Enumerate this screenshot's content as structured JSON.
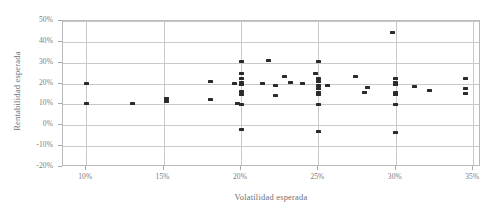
{
  "chart_data": {
    "type": "scatter",
    "title": "",
    "xlabel": "Volatilidad esperada",
    "ylabel": "Rentabilidad esperada",
    "xlim": [
      0.085,
      0.355
    ],
    "ylim": [
      -0.2,
      0.5
    ],
    "grid": true,
    "legend": false,
    "legend_position": "none",
    "x_ticks": [
      0.1,
      0.15,
      0.2,
      0.25,
      0.3,
      0.35
    ],
    "x_tick_labels": [
      "10%",
      "15%",
      "20%",
      "25%",
      "30%",
      "35%"
    ],
    "y_ticks": [
      -0.2,
      -0.1,
      0.0,
      0.1,
      0.2,
      0.3,
      0.4,
      0.5
    ],
    "y_tick_labels": [
      "-20%",
      "-10%",
      "0%",
      "10%",
      "20%",
      "30%",
      "40%",
      "50%"
    ],
    "marker": "square",
    "marker_color": "#2b2b2b",
    "series": [
      {
        "name": "Carteras",
        "points": [
          [
            0.1,
            0.2
          ],
          [
            0.1,
            0.105
          ],
          [
            0.13,
            0.105
          ],
          [
            0.152,
            0.128
          ],
          [
            0.152,
            0.115
          ],
          [
            0.18,
            0.21
          ],
          [
            0.18,
            0.125
          ],
          [
            0.196,
            0.2
          ],
          [
            0.198,
            0.105
          ],
          [
            0.2,
            0.305
          ],
          [
            0.2,
            0.25
          ],
          [
            0.2,
            0.225
          ],
          [
            0.2,
            0.205
          ],
          [
            0.2,
            0.195
          ],
          [
            0.2,
            0.16
          ],
          [
            0.2,
            0.148
          ],
          [
            0.2,
            0.1
          ],
          [
            0.2,
            -0.02
          ],
          [
            0.214,
            0.2
          ],
          [
            0.218,
            0.31
          ],
          [
            0.222,
            0.19
          ],
          [
            0.222,
            0.145
          ],
          [
            0.228,
            0.235
          ],
          [
            0.232,
            0.205
          ],
          [
            0.24,
            0.2
          ],
          [
            0.248,
            0.248
          ],
          [
            0.25,
            0.305
          ],
          [
            0.25,
            0.225
          ],
          [
            0.25,
            0.208
          ],
          [
            0.25,
            0.19
          ],
          [
            0.25,
            0.178
          ],
          [
            0.25,
            0.155
          ],
          [
            0.25,
            0.148
          ],
          [
            0.25,
            0.1
          ],
          [
            0.25,
            -0.03
          ],
          [
            0.256,
            0.19
          ],
          [
            0.274,
            0.235
          ],
          [
            0.28,
            0.158
          ],
          [
            0.282,
            0.182
          ],
          [
            0.298,
            0.445
          ],
          [
            0.3,
            0.225
          ],
          [
            0.3,
            0.205
          ],
          [
            0.3,
            0.195
          ],
          [
            0.3,
            0.155
          ],
          [
            0.3,
            0.148
          ],
          [
            0.3,
            0.1
          ],
          [
            0.3,
            -0.035
          ],
          [
            0.312,
            0.185
          ],
          [
            0.322,
            0.168
          ],
          [
            0.345,
            0.225
          ],
          [
            0.345,
            0.175
          ],
          [
            0.345,
            0.152
          ]
        ]
      }
    ]
  }
}
